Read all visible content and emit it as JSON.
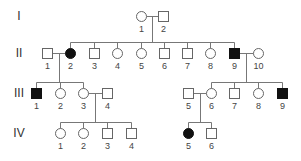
{
  "diagram": {
    "type": "pedigree",
    "colors": {
      "line": "#777777",
      "affected_fill": "#111111",
      "unaffected_fill": "#ffffff",
      "text": "#444444"
    },
    "generations": [
      {
        "label": "I",
        "x": 19,
        "y": 16
      },
      {
        "label": "II",
        "x": 19,
        "y": 53
      },
      {
        "label": "III",
        "x": 19,
        "y": 93
      },
      {
        "label": "IV",
        "x": 19,
        "y": 133
      }
    ],
    "individuals": [
      {
        "id": "I-1",
        "num": "1",
        "sex": "female",
        "affected": false,
        "x": 141,
        "y": 16
      },
      {
        "id": "I-2",
        "num": "2",
        "sex": "male",
        "affected": false,
        "x": 163,
        "y": 16
      },
      {
        "id": "II-1",
        "num": "1",
        "sex": "male",
        "affected": false,
        "x": 47,
        "y": 53
      },
      {
        "id": "II-2",
        "num": "2",
        "sex": "female",
        "affected": true,
        "x": 70,
        "y": 53
      },
      {
        "id": "II-3",
        "num": "3",
        "sex": "male",
        "affected": false,
        "x": 94,
        "y": 53
      },
      {
        "id": "II-4",
        "num": "4",
        "sex": "female",
        "affected": false,
        "x": 117,
        "y": 53
      },
      {
        "id": "II-5",
        "num": "5",
        "sex": "female",
        "affected": false,
        "x": 141,
        "y": 53
      },
      {
        "id": "II-6",
        "num": "6",
        "sex": "male",
        "affected": false,
        "x": 164,
        "y": 53
      },
      {
        "id": "II-7",
        "num": "7",
        "sex": "male",
        "affected": false,
        "x": 187,
        "y": 53
      },
      {
        "id": "II-8",
        "num": "8",
        "sex": "female",
        "affected": false,
        "x": 210,
        "y": 53
      },
      {
        "id": "II-9",
        "num": "9",
        "sex": "male",
        "affected": true,
        "x": 234,
        "y": 53
      },
      {
        "id": "II-10",
        "num": "10",
        "sex": "female",
        "affected": false,
        "x": 258,
        "y": 53
      },
      {
        "id": "III-1",
        "num": "1",
        "sex": "male",
        "affected": true,
        "x": 36,
        "y": 93
      },
      {
        "id": "III-2",
        "num": "2",
        "sex": "female",
        "affected": false,
        "x": 60,
        "y": 93
      },
      {
        "id": "III-3",
        "num": "3",
        "sex": "female",
        "affected": false,
        "x": 83,
        "y": 93
      },
      {
        "id": "III-4",
        "num": "4",
        "sex": "male",
        "affected": false,
        "x": 107,
        "y": 93
      },
      {
        "id": "III-5",
        "num": "5",
        "sex": "male",
        "affected": false,
        "x": 188,
        "y": 93
      },
      {
        "id": "III-6",
        "num": "6",
        "sex": "female",
        "affected": false,
        "x": 211,
        "y": 93
      },
      {
        "id": "III-7",
        "num": "7",
        "sex": "male",
        "affected": false,
        "x": 234,
        "y": 93
      },
      {
        "id": "III-8",
        "num": "8",
        "sex": "female",
        "affected": false,
        "x": 258,
        "y": 93
      },
      {
        "id": "III-9",
        "num": "9",
        "sex": "male",
        "affected": true,
        "x": 282,
        "y": 93
      },
      {
        "id": "IV-1",
        "num": "1",
        "sex": "female",
        "affected": false,
        "x": 60,
        "y": 133
      },
      {
        "id": "IV-2",
        "num": "2",
        "sex": "female",
        "affected": false,
        "x": 83,
        "y": 133
      },
      {
        "id": "IV-3",
        "num": "3",
        "sex": "male",
        "affected": false,
        "x": 107,
        "y": 133
      },
      {
        "id": "IV-4",
        "num": "4",
        "sex": "male",
        "affected": false,
        "x": 131,
        "y": 133
      },
      {
        "id": "IV-5",
        "num": "5",
        "sex": "female",
        "affected": true,
        "x": 188,
        "y": 133
      },
      {
        "id": "IV-6",
        "num": "6",
        "sex": "male",
        "affected": false,
        "x": 211,
        "y": 133
      }
    ],
    "lines": [
      [
        146,
        16,
        158,
        16
      ],
      [
        152,
        16,
        152,
        42
      ],
      [
        70,
        42,
        234,
        42
      ],
      [
        70,
        42,
        70,
        48
      ],
      [
        94,
        42,
        94,
        48
      ],
      [
        117,
        42,
        117,
        48
      ],
      [
        141,
        42,
        141,
        48
      ],
      [
        164,
        42,
        164,
        48
      ],
      [
        187,
        42,
        187,
        48
      ],
      [
        210,
        42,
        210,
        48
      ],
      [
        234,
        42,
        234,
        48
      ],
      [
        52,
        53,
        65,
        53
      ],
      [
        59,
        53,
        59,
        82
      ],
      [
        36,
        82,
        83,
        82
      ],
      [
        36,
        82,
        36,
        88
      ],
      [
        60,
        82,
        60,
        88
      ],
      [
        83,
        82,
        83,
        88
      ],
      [
        239,
        53,
        253,
        53
      ],
      [
        246,
        53,
        246,
        82
      ],
      [
        211,
        82,
        282,
        82
      ],
      [
        211,
        82,
        211,
        88
      ],
      [
        234,
        82,
        234,
        88
      ],
      [
        258,
        82,
        258,
        88
      ],
      [
        282,
        82,
        282,
        88
      ],
      [
        88,
        93,
        102,
        93
      ],
      [
        95,
        93,
        95,
        122
      ],
      [
        60,
        122,
        131,
        122
      ],
      [
        60,
        122,
        60,
        128
      ],
      [
        83,
        122,
        83,
        128
      ],
      [
        107,
        122,
        107,
        128
      ],
      [
        131,
        122,
        131,
        128
      ],
      [
        193,
        93,
        206,
        93
      ],
      [
        200,
        93,
        200,
        122
      ],
      [
        188,
        122,
        211,
        122
      ],
      [
        188,
        122,
        188,
        128
      ],
      [
        211,
        122,
        211,
        128
      ]
    ]
  }
}
